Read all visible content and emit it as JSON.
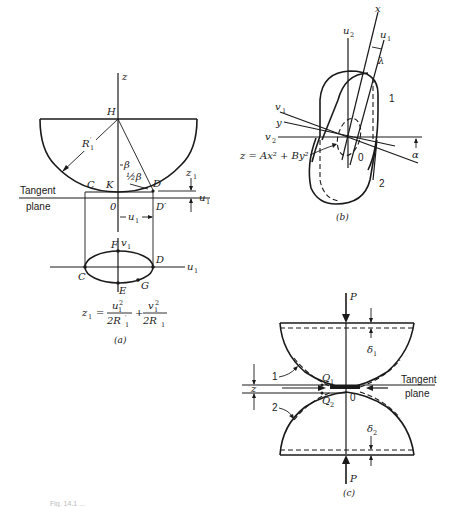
{
  "figure": {
    "panel_a": {
      "caption": "(a)",
      "axis_z": "z",
      "center_point": "H",
      "radius_label": "R",
      "radius_sup": "′",
      "radius_sub": "1",
      "angle_beta": "β",
      "angle_half_beta": "½β",
      "points": {
        "C": "C",
        "K": "K",
        "D": "D",
        "O": "0",
        "D_prime": "D′",
        "F": "F",
        "E": "E",
        "G": "G",
        "C2": "C",
        "D2": "D"
      },
      "tangent_plane_line1": "Tangent",
      "tangent_plane_line2": "plane",
      "z1_label": "z",
      "z1_sub": "1",
      "u1_label": "u",
      "u1_sub": "1",
      "v1_label": "v",
      "v1_sub": "1",
      "equation": {
        "lhs": "z",
        "lhs_sub": "1",
        "eq": "=",
        "num1": "u",
        "num1_sub": "1",
        "num1_sup": "2",
        "den1": "2R",
        "den1_sup": "′",
        "den1_sub": "1",
        "plus": "+",
        "num2": "v",
        "num2_sub": "1",
        "num2_sup": "2",
        "den2": "2R",
        "den2_sub": "1"
      }
    },
    "panel_b": {
      "caption": "(b)",
      "axis_x": "x",
      "axis_y": "y",
      "axis_u2": "u",
      "axis_u2_sub": "2",
      "axis_u1": "u",
      "axis_u1_sub": "1",
      "axis_v1": "v",
      "axis_v1_sub": "1",
      "axis_v2": "v",
      "axis_v2_sub": "2",
      "angle_lambda": "λ",
      "angle_alpha": "α",
      "origin": "0",
      "body1": "1",
      "body2": "2",
      "equation": "z = Ax² + By²"
    },
    "panel_c": {
      "caption": "(c)",
      "force_top": "P",
      "force_bottom": "P",
      "delta1": "δ",
      "delta1_sub": "1",
      "delta2": "δ",
      "delta2_sub": "2",
      "q1": "Q",
      "q1_sub": "1",
      "q2": "Q",
      "q2_sub": "2",
      "origin": "0",
      "body1": "1",
      "body2": "2",
      "gap_label": "z",
      "tangent_plane_line1": "Tangent",
      "tangent_plane_line2": "plane"
    },
    "figure_caption": "Fig. 14.1 ..."
  }
}
